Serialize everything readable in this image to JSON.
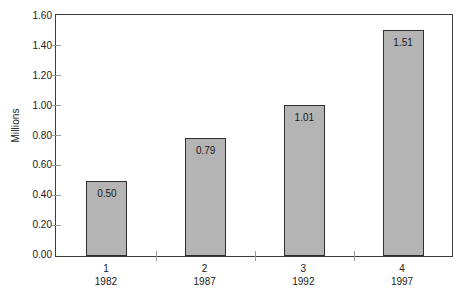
{
  "chart_data": {
    "type": "bar",
    "title": "",
    "subtitle": "",
    "xlabel": "",
    "ylabel": "Millions",
    "categories": [
      "1",
      "2",
      "3",
      "4"
    ],
    "category_sublabels": [
      "1982",
      "1987",
      "1992",
      "1997"
    ],
    "values": [
      0.5,
      0.79,
      1.01,
      1.51
    ],
    "value_labels": [
      "0.50",
      "0.79",
      "1.01",
      "1.51"
    ],
    "ylim": [
      0.0,
      1.6
    ],
    "ytick_values": [
      0.0,
      0.2,
      0.4,
      0.6,
      0.8,
      1.0,
      1.2,
      1.4,
      1.6
    ],
    "ytick_labels": [
      "0.00",
      "0.20",
      "0.40",
      "0.60",
      "0.80",
      "1.00",
      "1.20",
      "1.40",
      "1.60"
    ],
    "grid": false,
    "legend": false,
    "legend_position": "none",
    "series": [
      {
        "name": "",
        "values": [
          0.5,
          0.79,
          1.01,
          1.51
        ]
      }
    ],
    "colors": {
      "bar_fill": "#b4b4b4",
      "bar_border": "#2f2f2f",
      "axis": "#3d3d3d",
      "tick": "#9a9a9a",
      "text": "#1a1a1a",
      "background": "#ffffff"
    }
  }
}
